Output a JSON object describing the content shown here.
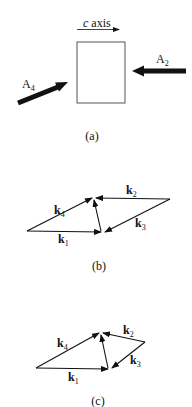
{
  "panel_a": {
    "axis_label_italic": "c",
    "axis_label_rest": " axis",
    "arrow_left_label": "A",
    "arrow_left_sub": "4",
    "arrow_right_label": "A",
    "arrow_right_sub": "2",
    "caption": "(a)"
  },
  "panel_b": {
    "k1": "k",
    "k1_sub": "1",
    "k2": "k",
    "k2_sub": "2",
    "k3": "k",
    "k3_sub": "3",
    "k4": "k",
    "k4_sub": "4",
    "caption": "(b)"
  },
  "panel_c": {
    "k1": "k",
    "k1_sub": "1",
    "k2": "k",
    "k2_sub": "2",
    "k3": "k",
    "k3_sub": "3",
    "k4": "k",
    "k4_sub": "4",
    "caption": "(c)"
  },
  "colors": {
    "ink": "#111111",
    "box": "#555555"
  }
}
